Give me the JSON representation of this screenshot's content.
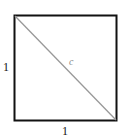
{
  "diagram": {
    "shape": "square",
    "side_left_label": "1",
    "side_bottom_label": "1",
    "diagonal_label": "c",
    "colors": {
      "square": "#111111",
      "diagonal": "#999999",
      "diagonal_label": "#888888"
    }
  }
}
